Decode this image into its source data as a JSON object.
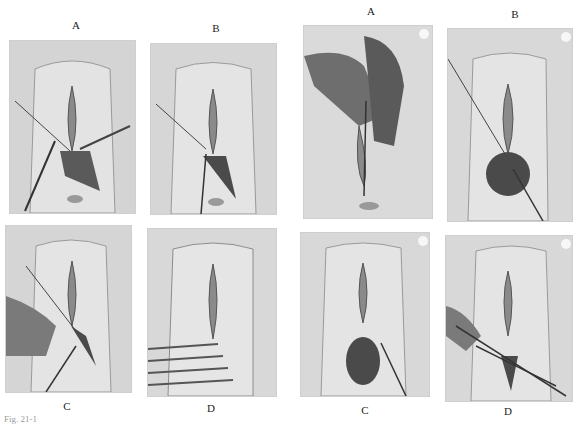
{
  "figure": {
    "left_set": {
      "panels": [
        {
          "label": "A",
          "description": "Incision with forceps and scissors; retraction sutures"
        },
        {
          "label": "B",
          "description": "Dissection of wound with suture held by forceps"
        },
        {
          "label": "C",
          "description": "Gloved hand with suture through perineal tissue"
        },
        {
          "label": "D",
          "description": "Closure with retractor bars across lower field"
        }
      ]
    },
    "right_set": {
      "panels": [
        {
          "label": "A",
          "description": "Gloved hands with instrument inserted"
        },
        {
          "label": "B",
          "description": "Opened perineal wound with instrument"
        },
        {
          "label": "C",
          "description": "Wound exposure with forceps"
        },
        {
          "label": "D",
          "description": "Suturing with needle holder and forceps"
        }
      ]
    },
    "caption_fragment": "Fig. 21-1"
  }
}
